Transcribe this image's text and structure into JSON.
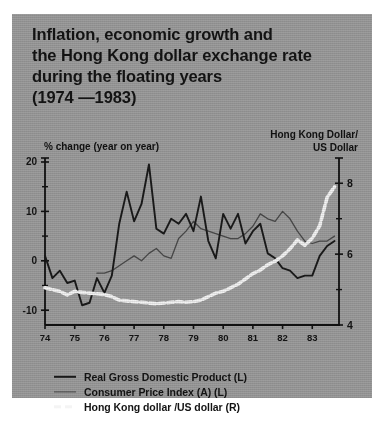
{
  "title": {
    "lines": [
      "Inflation, economic growth and",
      "the Hong Kong dollar exchange rate",
      "during the floating years",
      "(1974 —1983)"
    ]
  },
  "colors": {
    "panel_background": "#9d9d9d",
    "gdp_line": "#1a1a1a",
    "cpi_line": "#4a4a4a",
    "fx_line": "#f4f4f4",
    "axis": "#111111",
    "text": "#141414"
  },
  "axis_labels": {
    "left": "% change (year on year)",
    "right_line1": "Hong Kong Dollar/",
    "right_line2": "US Dollar"
  },
  "legend": {
    "items": [
      {
        "label": "Real Gross Domestic Product (L)",
        "style": "thick-black",
        "swatch": "gdp"
      },
      {
        "label": "Consumer Price Index (A) (L)",
        "style": "thin-gray",
        "swatch": "cpi"
      },
      {
        "label": "Hong Kong dollar /US dollar (R)",
        "style": "white-dashed",
        "swatch": "fx"
      }
    ]
  },
  "chart_data": {
    "type": "line",
    "title": "Inflation, economic growth and the Hong Kong dollar exchange rate during the floating years (1974 —1983)",
    "xlabel": "",
    "ylabel": "% change (year on year)",
    "y2label": "Hong Kong Dollar/US Dollar",
    "xlim": [
      1974.0,
      1983.9
    ],
    "ylim": [
      -13,
      20
    ],
    "y2lim": [
      8.6,
      4.0
    ],
    "y2_inverted": true,
    "grid": false,
    "legend_position": "below-plot",
    "xticks": [
      1974,
      1975,
      1976,
      1977,
      1978,
      1979,
      1980,
      1981,
      1982,
      1983
    ],
    "xticklabels": [
      "74",
      "75",
      "76",
      "77",
      "78",
      "79",
      "80",
      "81",
      "82",
      "83"
    ],
    "yticks": [
      -10,
      0,
      10,
      20
    ],
    "yticklabels": [
      "-10",
      "0",
      "10",
      "20"
    ],
    "yminorticks": [
      -5,
      5,
      15
    ],
    "y2ticks": [
      4,
      6,
      8
    ],
    "y2ticklabels": [
      "4",
      "6",
      "8"
    ],
    "y2minorticks": [
      5,
      7
    ],
    "series": [
      {
        "name": "Real Gross Domestic Product (L)",
        "axis": "left",
        "units": "% change (year on year)",
        "style": "thick-black",
        "x": [
          1974.0,
          1974.25,
          1974.5,
          1974.75,
          1975.0,
          1975.25,
          1975.5,
          1975.75,
          1976.0,
          1976.25,
          1976.5,
          1976.75,
          1977.0,
          1977.25,
          1977.5,
          1977.75,
          1978.0,
          1978.25,
          1978.5,
          1978.75,
          1979.0,
          1979.25,
          1979.5,
          1979.75,
          1980.0,
          1980.25,
          1980.5,
          1980.75,
          1981.0,
          1981.25,
          1981.5,
          1981.75,
          1982.0,
          1982.25,
          1982.5,
          1982.75,
          1983.0,
          1983.25,
          1983.5,
          1983.75
        ],
        "y": [
          1.0,
          -3.5,
          -2.0,
          -4.5,
          -4.0,
          -9.0,
          -8.5,
          -3.5,
          -6.5,
          -3.0,
          7.5,
          14.0,
          8.0,
          11.5,
          19.5,
          6.5,
          5.5,
          8.5,
          7.5,
          9.5,
          6.0,
          13.0,
          4.0,
          0.5,
          9.5,
          6.5,
          9.5,
          3.5,
          6.0,
          7.5,
          1.5,
          0.5,
          -1.5,
          -2.0,
          -3.5,
          -3.0,
          -3.0,
          1.0,
          3.0,
          4.0
        ]
      },
      {
        "name": "Consumer Price Index (A) (L)",
        "axis": "left",
        "units": "% change (year on year)",
        "style": "thin-gray",
        "x": [
          1975.75,
          1976.0,
          1976.25,
          1976.5,
          1976.75,
          1977.0,
          1977.25,
          1977.5,
          1977.75,
          1978.0,
          1978.25,
          1978.5,
          1978.75,
          1979.0,
          1979.25,
          1979.5,
          1979.75,
          1980.0,
          1980.25,
          1980.5,
          1980.75,
          1981.0,
          1981.25,
          1981.5,
          1981.75,
          1982.0,
          1982.25,
          1982.5,
          1982.75,
          1983.0,
          1983.25,
          1983.5,
          1983.75
        ],
        "y": [
          -2.5,
          -2.5,
          -2.0,
          -1.0,
          0.0,
          1.0,
          0.0,
          1.5,
          2.5,
          1.0,
          0.5,
          4.5,
          6.0,
          8.0,
          6.5,
          6.0,
          5.5,
          5.0,
          4.5,
          4.5,
          5.5,
          7.0,
          9.5,
          8.5,
          8.0,
          10.0,
          8.5,
          6.0,
          4.0,
          3.5,
          4.0,
          4.0,
          5.0
        ]
      },
      {
        "name": "Hong Kong dollar /US dollar (R)",
        "axis": "right",
        "units": "HKD per USD",
        "style": "white-dashed",
        "x": [
          1974.0,
          1974.25,
          1974.5,
          1974.75,
          1975.0,
          1975.25,
          1975.5,
          1975.75,
          1976.0,
          1976.25,
          1976.5,
          1976.75,
          1977.0,
          1977.25,
          1977.5,
          1977.75,
          1978.0,
          1978.25,
          1978.5,
          1978.75,
          1979.0,
          1979.25,
          1979.5,
          1979.75,
          1980.0,
          1980.25,
          1980.5,
          1980.75,
          1981.0,
          1981.25,
          1981.5,
          1981.75,
          1982.0,
          1982.25,
          1982.5,
          1982.75,
          1983.0,
          1983.25,
          1983.5,
          1983.75
        ],
        "y": [
          5.05,
          5.0,
          4.95,
          4.85,
          4.95,
          4.92,
          4.9,
          4.88,
          4.86,
          4.8,
          4.7,
          4.68,
          4.66,
          4.64,
          4.62,
          4.6,
          4.62,
          4.64,
          4.66,
          4.64,
          4.66,
          4.7,
          4.8,
          4.9,
          4.95,
          5.05,
          5.15,
          5.3,
          5.45,
          5.55,
          5.7,
          5.8,
          5.95,
          6.15,
          6.4,
          6.25,
          6.45,
          6.8,
          7.6,
          7.9
        ]
      }
    ]
  }
}
